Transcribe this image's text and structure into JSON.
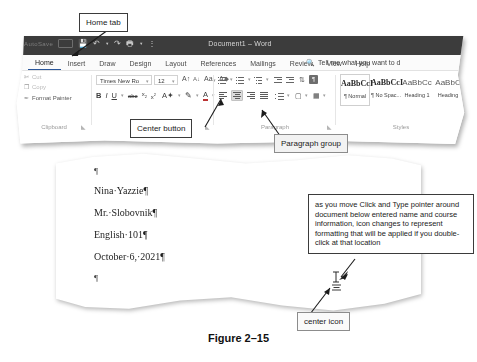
{
  "figure": {
    "caption": "Figure 2–15"
  },
  "word_window": {
    "title_bar": {
      "document_title": "Document1  –  Word",
      "quick_access": [
        "AutoSave",
        "Off",
        "save-icon",
        "undo-icon",
        "redo-icon",
        "print-icon",
        "customize-icon"
      ]
    },
    "tabs": [
      {
        "label": "Home",
        "active": true
      },
      {
        "label": "Insert",
        "active": false
      },
      {
        "label": "Draw",
        "active": false
      },
      {
        "label": "Design",
        "active": false
      },
      {
        "label": "Layout",
        "active": false
      },
      {
        "label": "References",
        "active": false
      },
      {
        "label": "Mailings",
        "active": false
      },
      {
        "label": "Review",
        "active": false
      },
      {
        "label": "View",
        "active": false
      },
      {
        "label": "Help",
        "active": false
      }
    ],
    "tell_me": "Tell me what you want to d",
    "groups": {
      "clipboard": {
        "name": "Clipboard",
        "items": [
          "Cut",
          "Copy",
          "Format Painter"
        ]
      },
      "font": {
        "name": "Font",
        "font_name": "Times New Ro",
        "font_size": "12",
        "tools": [
          "grow-font",
          "shrink-font",
          "change-case",
          "clear-formatting",
          "bold",
          "italic",
          "underline",
          "strikethrough",
          "subscript",
          "superscript",
          "text-effects",
          "highlight",
          "font-color"
        ],
        "bold": "B",
        "italic": "I",
        "underline": "U",
        "strikethrough": "abc",
        "subscript": "x",
        "superscript": "x",
        "grow": "A",
        "shrink": "A",
        "case": "Aa",
        "clear": "A"
      },
      "paragraph": {
        "name": "Paragraph",
        "row1": [
          "bullets",
          "numbering",
          "multilevel-list",
          "decrease-indent",
          "increase-indent",
          "sort",
          "show-formatting-marks"
        ],
        "row2": [
          "align-left",
          "center",
          "align-right",
          "justify",
          "line-spacing",
          "shading",
          "borders"
        ],
        "selected": "center",
        "pilcrow": "¶"
      },
      "styles": {
        "name": "Styles",
        "items": [
          {
            "preview": "AaBbCcI",
            "label": "¶ Normal",
            "selected": true
          },
          {
            "preview": "AaBbCcI",
            "label": "¶ No Spac...",
            "selected": false
          },
          {
            "preview": "AaBbCc",
            "label": "Heading 1",
            "selected": false
          },
          {
            "preview": "AaBbC",
            "label": "Heading",
            "selected": false
          }
        ]
      }
    }
  },
  "document": {
    "lines": [
      {
        "text": "¶",
        "type": "pilcrow-only"
      },
      {
        "text": "Nina·Yazzie¶",
        "type": "body"
      },
      {
        "text": "Mr.·Slobovnik¶",
        "type": "body"
      },
      {
        "text": "English·101¶",
        "type": "body"
      },
      {
        "text": "October·6,·2021¶",
        "type": "body"
      },
      {
        "text": "¶",
        "type": "pilcrow-only"
      }
    ]
  },
  "callouts": {
    "home_tab": "Home tab",
    "center_button": "Center button",
    "paragraph_group": "Paragraph group",
    "center_icon": "center icon",
    "click_and_type": "as you move Click and Type pointer around document below entered name and course information, icon changes to represent formatting that will be applied if you double-click at that location"
  },
  "colors": {
    "title_bar": "#3c3c3c",
    "accent": "#2b579a",
    "callout_border": "#3b3b3b",
    "page": "#ffffff",
    "text": "#1d1d1d"
  }
}
